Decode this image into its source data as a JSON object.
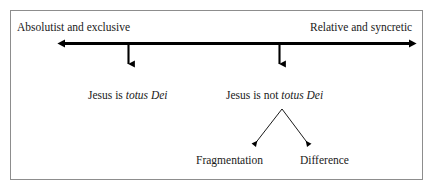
{
  "diagram": {
    "frame": {
      "border_color": "#8d8d8d",
      "background": "#ffffff"
    },
    "axis": {
      "name": "horizontal-spectrum-axis",
      "type": "double-headed-arrow",
      "color": "#000000",
      "left_pole_label": "Absolutist and exclusive",
      "right_pole_label": "Relative and syncretic"
    },
    "nodes": [
      {
        "id": "totus-dei",
        "text_plain": "Jesus is ",
        "text_italic": "totus Dei",
        "marker": "down-arrow"
      },
      {
        "id": "not-totus-dei",
        "text_plain": "Jesus is not ",
        "text_italic": "totus Dei",
        "marker": "down-arrow"
      }
    ],
    "branches": [
      {
        "id": "fragmentation",
        "label": "Fragmentation",
        "marker": "down-left-arrow"
      },
      {
        "id": "difference",
        "label": "Difference",
        "marker": "down-right-arrow"
      }
    ]
  }
}
